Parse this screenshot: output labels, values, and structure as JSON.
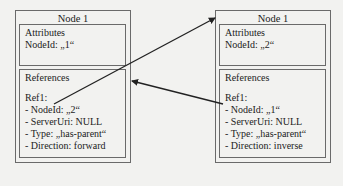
{
  "nodes": [
    {
      "title": "Node 1",
      "attributes": {
        "heading": "Attributes",
        "node_id": "NodeId: „1“"
      },
      "references": {
        "heading": "References",
        "ref_label": "Ref1:",
        "items": [
          "- NodeId: „2“",
          "- ServerUri: NULL",
          "- Type: „has-parent“",
          "- Direction: forward"
        ]
      }
    },
    {
      "title": "Node 1",
      "attributes": {
        "heading": "Attributes",
        "node_id": "NodeId: „2“"
      },
      "references": {
        "heading": "References",
        "ref_label": "Ref1:",
        "items": [
          "- NodeId: „1“",
          "- ServerUri: NULL",
          "- Type: „has-parent“",
          "- Direction: inverse"
        ]
      }
    }
  ],
  "arrows": [
    {
      "from": "node-1-ref1",
      "to": "node-2-top-left",
      "label": "forward reference"
    },
    {
      "from": "node-2-ref1",
      "to": "node-1-right-edge",
      "label": "inverse reference"
    }
  ],
  "colors": {
    "border": "#6a6a6a",
    "background": "#f2f2f0",
    "arrow": "#222222"
  }
}
